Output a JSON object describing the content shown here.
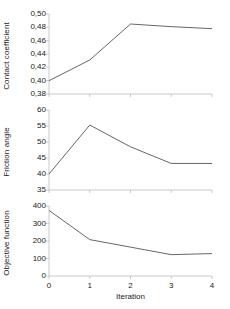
{
  "chart_data": [
    {
      "type": "line",
      "panel_index": 0,
      "title": "",
      "xlabel": "",
      "ylabel": "Contact coefficient",
      "x": [
        0,
        1,
        2,
        3,
        4
      ],
      "values": [
        0.4,
        0.431,
        0.485,
        0.481,
        0.478
      ],
      "categories": [
        "0",
        "1",
        "2",
        "3",
        "4"
      ],
      "xlim": [
        0,
        4
      ],
      "ylim": [
        0.38,
        0.5
      ],
      "yticks": [
        0.38,
        0.4,
        0.42,
        0.44,
        0.46,
        0.48,
        0.5
      ],
      "ytick_labels": [
        "0,38",
        "0,40",
        "0,42",
        "0,44",
        "0,46",
        "0,48",
        "0,50"
      ],
      "grid": false,
      "line_color": "#666666"
    },
    {
      "type": "line",
      "panel_index": 1,
      "title": "",
      "xlabel": "",
      "ylabel": "Friction angle",
      "x": [
        0,
        1,
        2,
        3,
        4
      ],
      "values": [
        40.0,
        55.3,
        48.5,
        43.3,
        43.3
      ],
      "categories": [
        "0",
        "1",
        "2",
        "3",
        "4"
      ],
      "xlim": [
        0,
        4
      ],
      "ylim": [
        35,
        60
      ],
      "yticks": [
        35,
        40,
        45,
        50,
        55,
        60
      ],
      "ytick_labels": [
        "35",
        "40",
        "45",
        "50",
        "55",
        "60"
      ],
      "grid": false,
      "line_color": "#666666"
    },
    {
      "type": "line",
      "panel_index": 2,
      "title": "",
      "xlabel": "Iteration",
      "ylabel": "Objective function",
      "x": [
        0,
        1,
        2,
        3,
        4
      ],
      "values": [
        375,
        208,
        165,
        122,
        128
      ],
      "categories": [
        "0",
        "1",
        "2",
        "3",
        "4"
      ],
      "xlim": [
        0,
        4
      ],
      "ylim": [
        0,
        400
      ],
      "yticks": [
        0,
        100,
        200,
        300,
        400
      ],
      "ytick_labels": [
        "0",
        "100",
        "200",
        "300",
        "400"
      ],
      "grid": false,
      "line_color": "#666666"
    }
  ],
  "axes": {
    "xtick_labels": [
      "0",
      "1",
      "2",
      "3",
      "4"
    ],
    "xlabel": "Iteration"
  },
  "style": {
    "axis_color": "#bdbdbd",
    "line_color": "#666666",
    "text_color": "#1a1a1a",
    "background": "#ffffff"
  }
}
